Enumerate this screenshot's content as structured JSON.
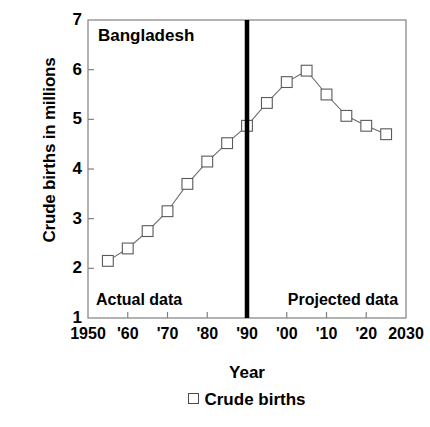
{
  "chart_data": {
    "type": "line",
    "title": "Bangladesh",
    "xlabel": "Year",
    "ylabel": "Crude births in millions",
    "xlim": [
      1950,
      2030
    ],
    "ylim": [
      1,
      7
    ],
    "grid": false,
    "legend_position": "bottom-center",
    "series": [
      {
        "name": "Crude births",
        "marker": "open-square",
        "x": [
          1955,
          1960,
          1965,
          1970,
          1975,
          1980,
          1985,
          1990,
          1995,
          2000,
          2005,
          2010,
          2015,
          2020,
          2025
        ],
        "values": [
          2.15,
          2.4,
          2.75,
          3.15,
          3.7,
          4.15,
          4.52,
          4.87,
          5.33,
          5.75,
          5.98,
          5.5,
          5.07,
          4.87,
          4.7
        ]
      }
    ],
    "xticks": [
      1950,
      1960,
      1970,
      1980,
      1990,
      2000,
      2010,
      2020,
      2030
    ],
    "xtick_labels": [
      "1950",
      "'60",
      "'70",
      "'80",
      "'90",
      "'00",
      "'10",
      "'20",
      "2030"
    ],
    "yticks": [
      1,
      2,
      3,
      4,
      5,
      6,
      7
    ],
    "ytick_labels": [
      "1",
      "2",
      "3",
      "4",
      "5",
      "6",
      "7"
    ],
    "annotations": [
      {
        "text": "Bangladesh",
        "x": 1952.5,
        "y": 6.65,
        "align": "left"
      },
      {
        "text": "Actual data",
        "x": 1952.0,
        "y": 1.32,
        "align": "left"
      },
      {
        "text": "Projected data",
        "x": 2028.0,
        "y": 1.32,
        "align": "right"
      }
    ],
    "divider": {
      "x": 1990,
      "label": "actual-vs-projected-divider"
    },
    "legend_entries": [
      {
        "label": "Crude births",
        "marker": "open-square"
      }
    ],
    "colors": {
      "line": "#6b6b6b",
      "marker_edge": "#5a5a5a",
      "marker_fill": "#ffffff",
      "axis": "#808080",
      "divider": "#000000",
      "text": "#000000"
    }
  }
}
